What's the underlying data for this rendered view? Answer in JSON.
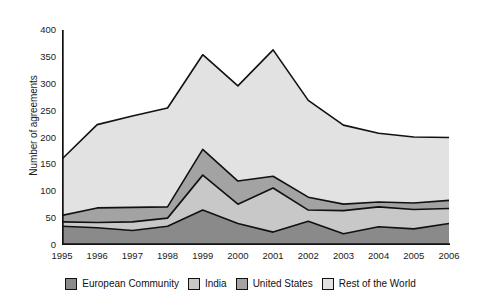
{
  "chart_data": {
    "type": "area",
    "stacked": true,
    "title": "",
    "xlabel": "",
    "ylabel": "Number of agreements",
    "categories": [
      "1995",
      "1996",
      "1997",
      "1998",
      "1999",
      "2000",
      "2001",
      "2002",
      "2003",
      "2004",
      "2005",
      "2006"
    ],
    "x": [
      1995,
      1996,
      1997,
      1998,
      1999,
      2000,
      2001,
      2002,
      2003,
      2004,
      2005,
      2006
    ],
    "ylim": [
      0,
      400
    ],
    "yticks": [
      0,
      50,
      100,
      150,
      200,
      250,
      300,
      350,
      400
    ],
    "grid": false,
    "legend_position": "bottom",
    "series": [
      {
        "name": "European Community",
        "color": "#8a8a8a",
        "values": [
          35,
          32,
          27,
          35,
          65,
          40,
          24,
          44,
          21,
          34,
          30,
          40
        ]
      },
      {
        "name": "India",
        "color": "#c8c8c8",
        "values": [
          8,
          10,
          16,
          15,
          65,
          36,
          82,
          21,
          43,
          37,
          36,
          28
        ]
      },
      {
        "name": "United States",
        "color": "#a3a3a3",
        "values": [
          12,
          27,
          27,
          21,
          48,
          43,
          22,
          24,
          12,
          9,
          12,
          15
        ]
      },
      {
        "name": "Rest of the World",
        "color": "#e2e2e2",
        "values": [
          105,
          155,
          170,
          184,
          176,
          177,
          235,
          180,
          147,
          128,
          123,
          117
        ]
      }
    ],
    "totals": [
      160,
      224,
      240,
      255,
      354,
      296,
      363,
      269,
      223,
      208,
      201,
      200
    ]
  },
  "legend": {
    "items": [
      {
        "label": "European Community",
        "color": "#8a8a8a"
      },
      {
        "label": "India",
        "color": "#c8c8c8"
      },
      {
        "label": "United States",
        "color": "#a3a3a3"
      },
      {
        "label": "Rest of the World",
        "color": "#e2e2e2"
      }
    ]
  },
  "axes": {
    "y_title": "Number of agreements",
    "y_ticks": [
      "400",
      "350",
      "300",
      "250",
      "200",
      "150",
      "100",
      "50",
      "0"
    ],
    "x_ticks": [
      "1995",
      "1996",
      "1997",
      "1998",
      "1999",
      "2000",
      "2001",
      "2002",
      "2003",
      "2004",
      "2005",
      "2006"
    ]
  }
}
